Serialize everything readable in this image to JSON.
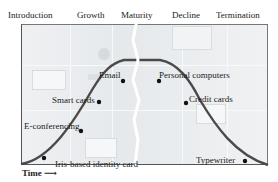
{
  "phases": [
    {
      "label": "Introduction",
      "x": 4
    },
    {
      "label": "Growth",
      "x": 77
    },
    {
      "label": "Maturity",
      "x": 119
    },
    {
      "label": "Decline",
      "x": 172
    },
    {
      "label": "Termination",
      "x": 216
    }
  ],
  "axes": {
    "y_label": "Saturation",
    "x_label": "Time"
  },
  "technologies": [
    {
      "label": "Iris-based identity card",
      "phase": "Introduction"
    },
    {
      "label": "E-conferencing",
      "phase": "Growth"
    },
    {
      "label": "Smart cards",
      "phase": "Growth"
    },
    {
      "label": "Email",
      "phase": "Maturity"
    },
    {
      "label": "Personal computers",
      "phase": "Maturity"
    },
    {
      "label": "Credit cards",
      "phase": "Decline"
    },
    {
      "label": "Typewriter",
      "phase": "Termination"
    }
  ],
  "colors": {
    "curve": "#4a4a4a",
    "dot": "#111111",
    "background": "#e8ebee"
  }
}
